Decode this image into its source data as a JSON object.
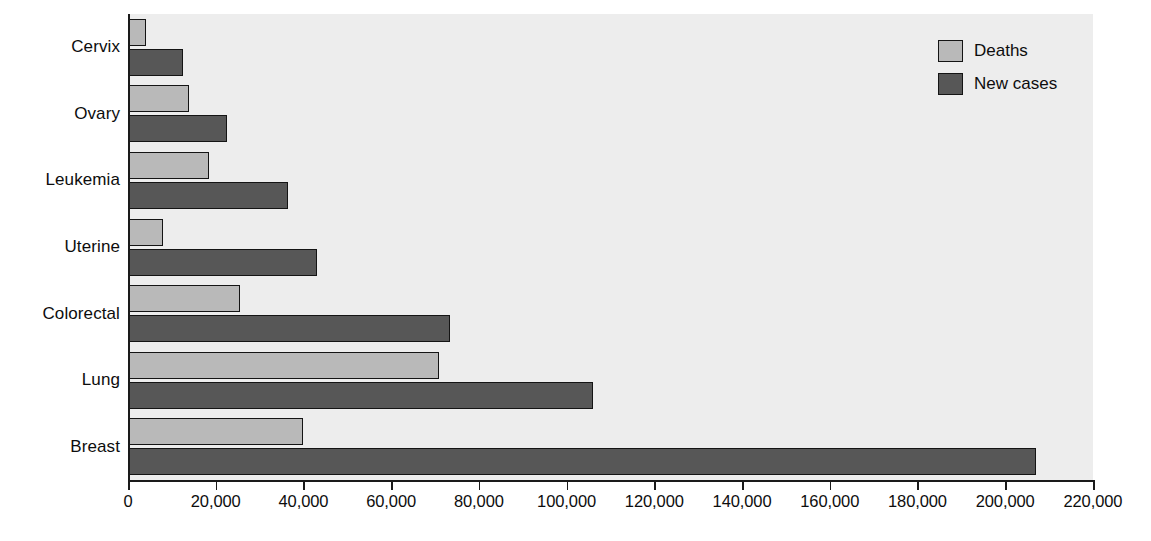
{
  "chart_data": {
    "type": "bar",
    "orientation": "horizontal",
    "title": "",
    "xlabel": "",
    "ylabel": "",
    "xlim": [
      0,
      220000
    ],
    "grid": false,
    "categories": [
      "Breast",
      "Lung",
      "Colorectal",
      "Uterine",
      "Leukemia",
      "Ovary",
      "Cervix"
    ],
    "series": [
      {
        "name": "Deaths",
        "color": "#b9b9b9",
        "values": [
          40000,
          71000,
          25500,
          8000,
          18500,
          14000,
          4000
        ]
      },
      {
        "name": "New cases",
        "color": "#575757",
        "values": [
          207000,
          106000,
          73500,
          43000,
          36500,
          22500,
          12500
        ]
      }
    ],
    "xticks": [
      0,
      20000,
      40000,
      60000,
      80000,
      100000,
      120000,
      140000,
      160000,
      180000,
      200000,
      220000
    ],
    "xticklabels": [
      "0",
      "20,000",
      "40,000",
      "60,000",
      "80,000",
      "100,000",
      "120,000",
      "140,000",
      "160,000",
      "180,000",
      "200,000",
      "220,000"
    ],
    "legend_position": "top-right"
  },
  "legend": {
    "items": [
      {
        "label": "Deaths",
        "swatch": "deaths"
      },
      {
        "label": "New cases",
        "swatch": "newcases"
      }
    ]
  },
  "colors": {
    "deaths": "#b9b9b9",
    "new_cases": "#575757",
    "plot_background": "#ededed",
    "axis": "#1a1a1a",
    "text": "#0d0d0d"
  }
}
